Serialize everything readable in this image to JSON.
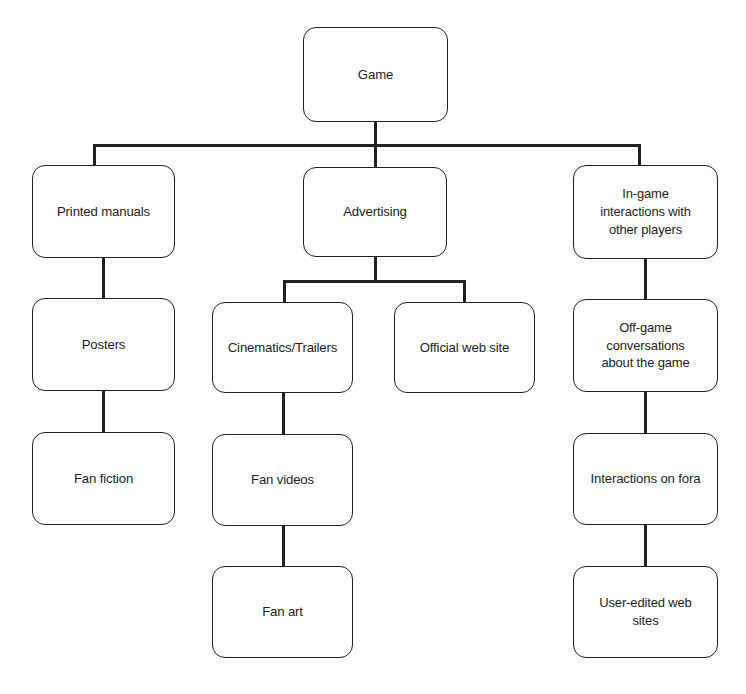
{
  "diagram": {
    "type": "tree",
    "canvas": {
      "width": 746,
      "height": 694
    },
    "style": {
      "background": "#ffffff",
      "node_fill": "#ffffff",
      "node_stroke": "#231f20",
      "connector_color": "#231f20",
      "text_color": "#221e1f"
    },
    "nodes": [
      {
        "id": "game",
        "label": "Game",
        "x": 303,
        "y": 27,
        "w": 145,
        "h": 95,
        "level": 0,
        "multiline": false
      },
      {
        "id": "printed-manuals",
        "label": "Printed manuals",
        "x": 32,
        "y": 165,
        "w": 143,
        "h": 93,
        "level": 1,
        "multiline": false
      },
      {
        "id": "advertising",
        "label": "Advertising",
        "x": 303,
        "y": 167,
        "w": 144,
        "h": 90,
        "level": 1,
        "multiline": false
      },
      {
        "id": "in-game-interactions",
        "label": "In-game\ninteractions with\nother players",
        "x": 573,
        "y": 165,
        "w": 145,
        "h": 94,
        "level": 1,
        "multiline": true
      },
      {
        "id": "posters",
        "label": "Posters",
        "x": 32,
        "y": 298,
        "w": 143,
        "h": 93,
        "level": 2,
        "multiline": false
      },
      {
        "id": "cinematics-trailers",
        "label": "Cinematics/Trailers",
        "x": 212,
        "y": 302,
        "w": 141,
        "h": 91,
        "level": 2,
        "multiline": false
      },
      {
        "id": "official-web-site",
        "label": "Official web site",
        "x": 394,
        "y": 302,
        "w": 141,
        "h": 91,
        "level": 2,
        "multiline": false
      },
      {
        "id": "off-game-conversations",
        "label": "Off-game\nconversations\nabout the game",
        "x": 573,
        "y": 299,
        "w": 145,
        "h": 93,
        "level": 2,
        "multiline": true
      },
      {
        "id": "fan-fiction",
        "label": "Fan fiction",
        "x": 32,
        "y": 432,
        "w": 143,
        "h": 93,
        "level": 3,
        "multiline": false
      },
      {
        "id": "fan-videos",
        "label": "Fan videos",
        "x": 212,
        "y": 434,
        "w": 141,
        "h": 92,
        "level": 3,
        "multiline": false
      },
      {
        "id": "interactions-on-fora",
        "label": "Interactions on fora",
        "x": 573,
        "y": 433,
        "w": 145,
        "h": 92,
        "level": 3,
        "multiline": false
      },
      {
        "id": "fan-art",
        "label": "Fan art",
        "x": 212,
        "y": 566,
        "w": 141,
        "h": 92,
        "level": 4,
        "multiline": false
      },
      {
        "id": "user-edited-web-sites",
        "label": "User-edited web\nsites",
        "x": 573,
        "y": 566,
        "w": 145,
        "h": 92,
        "level": 4,
        "multiline": true
      }
    ],
    "edges": [
      {
        "from": "game",
        "to": "printed-manuals",
        "kind": "elbow"
      },
      {
        "from": "game",
        "to": "advertising",
        "kind": "straight"
      },
      {
        "from": "game",
        "to": "in-game-interactions",
        "kind": "elbow"
      },
      {
        "from": "printed-manuals",
        "to": "posters",
        "kind": "straight"
      },
      {
        "from": "posters",
        "to": "fan-fiction",
        "kind": "straight"
      },
      {
        "from": "advertising",
        "to": "cinematics-trailers",
        "kind": "elbow"
      },
      {
        "from": "advertising",
        "to": "official-web-site",
        "kind": "elbow"
      },
      {
        "from": "cinematics-trailers",
        "to": "fan-videos",
        "kind": "straight"
      },
      {
        "from": "fan-videos",
        "to": "fan-art",
        "kind": "straight"
      },
      {
        "from": "in-game-interactions",
        "to": "off-game-conversations",
        "kind": "straight"
      },
      {
        "from": "off-game-conversations",
        "to": "interactions-on-fora",
        "kind": "straight"
      },
      {
        "from": "interactions-on-fora",
        "to": "user-edited-web-sites",
        "kind": "straight"
      }
    ]
  }
}
